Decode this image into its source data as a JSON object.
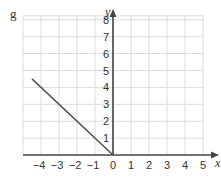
{
  "panel_label": "g",
  "chart_data": {
    "type": "line",
    "title": "",
    "xlabel": "x",
    "ylabel": "y",
    "xlim": [
      -5,
      5
    ],
    "ylim": [
      0,
      8
    ],
    "grid": true,
    "x_ticks": [
      "-4",
      "-3",
      "-2",
      "-1",
      "0",
      "1",
      "2",
      "3",
      "4",
      "5"
    ],
    "y_ticks": [
      "1",
      "2",
      "3",
      "4",
      "5",
      "6",
      "7",
      "8"
    ],
    "series": [
      {
        "name": "line",
        "x": [
          -4.5,
          0
        ],
        "y": [
          4.5,
          0
        ],
        "color": "#555555"
      }
    ]
  },
  "colors": {
    "grid": "#dcdcdc",
    "axis": "#444444",
    "line": "#555555"
  }
}
